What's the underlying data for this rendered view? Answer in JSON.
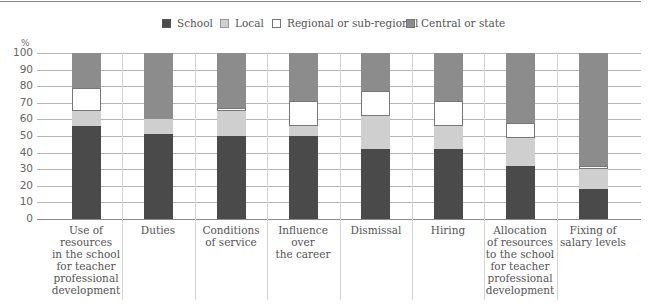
{
  "chart_data": {
    "type": "bar",
    "stacked": true,
    "title": "",
    "xlabel": "",
    "ylabel": "%",
    "ylim": [
      0,
      100
    ],
    "yticks": [
      0,
      10,
      20,
      30,
      40,
      50,
      60,
      70,
      80,
      90,
      100
    ],
    "grid": true,
    "legend_position": "top",
    "categories": [
      "Use of resources in the school for teacher professional development",
      "Duties",
      "Conditions of service",
      "Influence over the career",
      "Dismissal",
      "Hiring",
      "Allocation of resources to the school for teacher professional development",
      "Fixing of salary levels"
    ],
    "category_label_lines": [
      [
        "Use of resources",
        "in the school",
        "for teacher",
        "professional",
        "development"
      ],
      [
        "Duties"
      ],
      [
        "Conditions",
        "of service"
      ],
      [
        "Influence",
        "over",
        "the career"
      ],
      [
        "Dismissal"
      ],
      [
        "Hiring"
      ],
      [
        "Allocation",
        "of resources",
        "to the school",
        "for teacher",
        "professional",
        "development"
      ],
      [
        "Fixing of",
        "salary levels"
      ]
    ],
    "series": [
      {
        "name": "School",
        "color": "#4a4a4a",
        "values": [
          56,
          51,
          50,
          50,
          42,
          42,
          32,
          18
        ]
      },
      {
        "name": "Local",
        "color": "#cfcfcf",
        "values": [
          9,
          9,
          15,
          6,
          20,
          14,
          17,
          12
        ]
      },
      {
        "name": "Regional or sub-regional",
        "color": "#ffffff",
        "values": [
          14,
          0,
          2,
          15,
          15,
          15,
          9,
          2
        ]
      },
      {
        "name": "Central or state",
        "color": "#8c8c8c",
        "values": [
          21,
          40,
          33,
          29,
          23,
          29,
          42,
          68
        ]
      }
    ]
  },
  "legend": [
    {
      "label": "School",
      "color": "#4a4a4a"
    },
    {
      "label": "Local",
      "color": "#cfcfcf"
    },
    {
      "label": "Regional or sub-regional",
      "color": "#ffffff"
    },
    {
      "label": "Central or state",
      "color": "#8c8c8c"
    }
  ],
  "axis": {
    "unit": "%"
  }
}
